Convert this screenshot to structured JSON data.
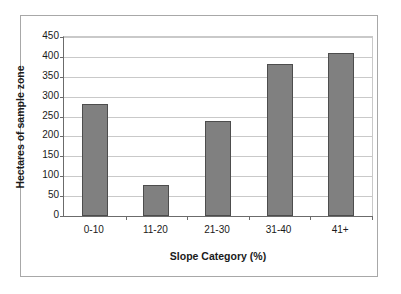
{
  "chart_data": {
    "type": "bar",
    "title": "",
    "categories": [
      "0-10",
      "11-20",
      "21-30",
      "31-40",
      "41+"
    ],
    "values": [
      282,
      77,
      240,
      381,
      411
    ],
    "series": [
      {
        "name": "Hectares of sample zone",
        "values": [
          282,
          77,
          240,
          381,
          411
        ]
      }
    ],
    "xlabel": "Slope Category (%)",
    "ylabel": "Hectares of sample zone",
    "ylim": [
      0,
      450
    ],
    "ytick_step": 50,
    "yticks": [
      0,
      50,
      100,
      150,
      200,
      250,
      300,
      350,
      400,
      450
    ],
    "ytick_labels": [
      "0",
      "50",
      "100",
      "150",
      "200",
      "250",
      "300",
      "350",
      "400",
      "450"
    ],
    "grid": true,
    "grid_axis": "y",
    "legend": false,
    "legend_position": "none",
    "bar_color": "#808080",
    "bar_edge_color": "#4d4d4d",
    "grid_color": "#c9c9c9",
    "axis_color": "#6b6b6b",
    "frame_color": "#a8a8a8",
    "background_color": "#ffffff"
  }
}
